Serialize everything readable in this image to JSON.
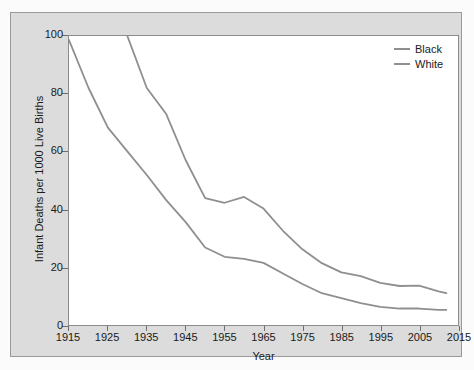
{
  "chart_data": {
    "type": "line",
    "title": "",
    "xlabel": "Year",
    "ylabel": "Infant Deaths per 1000 Live Births",
    "xlim": [
      1915,
      2015
    ],
    "ylim": [
      0,
      100
    ],
    "grid": false,
    "legend_position": "top-right",
    "xticks": [
      1915,
      1925,
      1935,
      1945,
      1955,
      1965,
      1975,
      1985,
      1995,
      2005,
      2015
    ],
    "yticks": [
      0,
      20,
      40,
      60,
      80,
      100
    ],
    "series": [
      {
        "name": "Black",
        "color": "#8f8f8f",
        "x": [
          1930,
          1935,
          1940,
          1945,
          1950,
          1955,
          1960,
          1965,
          1970,
          1975,
          1980,
          1985,
          1990,
          1995,
          2000,
          2005,
          2010,
          2012
        ],
        "values": [
          100,
          82,
          73,
          57,
          43.9,
          42.3,
          44.3,
          40.3,
          32.6,
          26.2,
          21.4,
          18.2,
          16.9,
          14.6,
          13.5,
          13.6,
          11.6,
          11.0
        ]
      },
      {
        "name": "White",
        "color": "#8f8f8f",
        "x": [
          1915,
          1920,
          1925,
          1930,
          1935,
          1940,
          1945,
          1950,
          1955,
          1960,
          1965,
          1970,
          1975,
          1980,
          1985,
          1990,
          1995,
          2000,
          2005,
          2010,
          2012
        ],
        "values": [
          98.6,
          82.1,
          68.3,
          60.1,
          51.9,
          43.2,
          35.6,
          26.8,
          23.6,
          22.9,
          21.5,
          17.8,
          14.2,
          11.0,
          9.3,
          7.6,
          6.3,
          5.7,
          5.7,
          5.2,
          5.2
        ]
      }
    ]
  },
  "legend": {
    "items": [
      {
        "label": "Black"
      },
      {
        "label": "White"
      }
    ]
  },
  "axes": {
    "y_title": "Infant Deaths per 1000 Live Births",
    "x_title": "Year",
    "y_tick_labels": [
      "0",
      "20",
      "40",
      "60",
      "80",
      "100"
    ],
    "x_tick_labels": [
      "1915",
      "1925",
      "1935",
      "1945",
      "1955",
      "1965",
      "1975",
      "1985",
      "1995",
      "2005",
      "2015"
    ]
  },
  "colors": {
    "line": "#8f8f8f",
    "panel_background": "#dcdcdc",
    "plot_background": "#ffffff",
    "axis": "#8c8c8c",
    "text": "#1a1a1a"
  }
}
